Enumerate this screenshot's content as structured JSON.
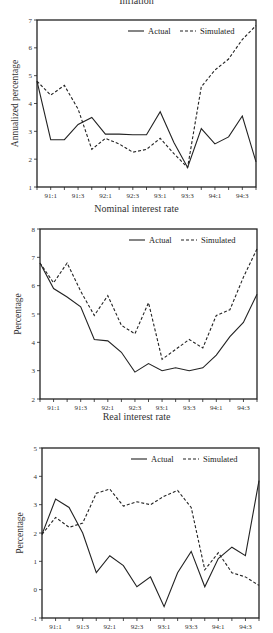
{
  "chart_data": [
    {
      "type": "line",
      "title": "Inflation",
      "xlabel": "",
      "ylabel": "Annualized percentage",
      "ylim": [
        1,
        7
      ],
      "yticks": [
        1,
        2,
        3,
        4,
        5,
        6,
        7
      ],
      "x": [
        "90:4",
        "91:1",
        "91:2",
        "91:3",
        "91:4",
        "92:1",
        "92:2",
        "92:3",
        "92:4",
        "93:1",
        "93:2",
        "93:3",
        "93:4",
        "94:1",
        "94:2",
        "94:3",
        "94:4"
      ],
      "xtick_labels": [
        "91:1",
        "91:3",
        "92:1",
        "92:3",
        "93:1",
        "93:3",
        "94:1",
        "94:3"
      ],
      "legend": [
        "Actual",
        "Simulated"
      ],
      "legend_position": "top-right",
      "grid": false,
      "series": [
        {
          "name": "Actual",
          "style": "solid",
          "values": [
            4.8,
            2.7,
            2.7,
            3.25,
            3.5,
            2.9,
            2.9,
            2.88,
            2.88,
            3.7,
            2.6,
            1.7,
            3.1,
            2.55,
            2.8,
            3.55,
            1.9
          ]
        },
        {
          "name": "Simulated",
          "style": "dashed",
          "values": [
            4.8,
            4.3,
            4.65,
            3.8,
            2.35,
            2.75,
            2.55,
            2.25,
            2.35,
            2.75,
            2.2,
            1.7,
            4.6,
            5.2,
            5.6,
            6.3,
            6.8
          ]
        }
      ]
    },
    {
      "type": "line",
      "title": "Nominal interest rate",
      "xlabel": "",
      "ylabel": "Percentage",
      "ylim": [
        2,
        8
      ],
      "yticks": [
        2,
        3,
        4,
        5,
        6,
        7,
        8
      ],
      "x": [
        "90:4",
        "91:1",
        "91:2",
        "91:3",
        "91:4",
        "92:1",
        "92:2",
        "92:3",
        "92:4",
        "93:1",
        "93:2",
        "93:3",
        "93:4",
        "94:1",
        "94:2",
        "94:3",
        "94:4"
      ],
      "xtick_labels": [
        "91:1",
        "91:3",
        "92:1",
        "92:3",
        "93:1",
        "93:3",
        "94:1",
        "94:3"
      ],
      "legend": [
        "Actual",
        "Simulated"
      ],
      "legend_position": "top-right",
      "grid": false,
      "series": [
        {
          "name": "Actual",
          "style": "solid",
          "values": [
            6.8,
            5.9,
            5.6,
            5.25,
            4.1,
            4.05,
            3.65,
            2.95,
            3.25,
            3.0,
            3.1,
            3.0,
            3.1,
            3.55,
            4.2,
            4.7,
            5.7
          ]
        },
        {
          "name": "Simulated",
          "style": "dashed",
          "values": [
            6.8,
            6.1,
            6.8,
            5.8,
            4.95,
            5.65,
            4.6,
            4.3,
            5.4,
            3.4,
            3.75,
            4.1,
            3.8,
            4.95,
            5.15,
            6.3,
            7.3
          ]
        }
      ]
    },
    {
      "type": "line",
      "title": "Real interest rate",
      "xlabel": "",
      "ylabel": "Percentage",
      "ylim": [
        -1,
        5
      ],
      "yticks": [
        -1,
        0,
        1,
        2,
        3,
        4,
        5
      ],
      "x": [
        "90:4",
        "91:1",
        "91:2",
        "91:3",
        "91:4",
        "92:1",
        "92:2",
        "92:3",
        "92:4",
        "93:1",
        "93:2",
        "93:3",
        "93:4",
        "94:1",
        "94:2",
        "94:3",
        "94:4"
      ],
      "xtick_labels": [
        "91:1",
        "91:3",
        "92:1",
        "92:3",
        "93:1",
        "93:3",
        "94:1",
        "94:3"
      ],
      "legend": [
        "Actual",
        "Simulated"
      ],
      "legend_position": "top-right",
      "grid": false,
      "series": [
        {
          "name": "Actual",
          "style": "solid",
          "values": [
            1.95,
            3.2,
            2.9,
            2.0,
            0.6,
            1.2,
            0.85,
            0.1,
            0.45,
            -0.6,
            0.6,
            1.35,
            0.1,
            1.1,
            1.5,
            1.2,
            3.85
          ]
        },
        {
          "name": "Simulated",
          "style": "dashed",
          "values": [
            1.95,
            2.55,
            2.2,
            2.35,
            3.4,
            3.55,
            2.95,
            3.1,
            3.0,
            3.3,
            3.5,
            2.9,
            0.7,
            1.3,
            0.6,
            0.45,
            0.15
          ]
        }
      ]
    }
  ],
  "panels": [
    {
      "title": "Inflation",
      "ylabel": "Annualized percentage"
    },
    {
      "title": "Nominal interest rate",
      "ylabel": "Percentage"
    },
    {
      "title": "Real interest rate",
      "ylabel": "Percentage"
    }
  ],
  "legend": {
    "actual_label": "Actual",
    "simulated_label": "Simulated"
  },
  "colors": {
    "line": "#222222",
    "axis": "#222222",
    "background": "#ffffff"
  }
}
